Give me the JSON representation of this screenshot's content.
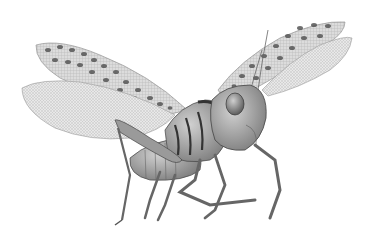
{
  "image": {
    "subject": "locust",
    "description": "Grayscale illustration of a flying locust with spotted forewings and translucent veined hindwings",
    "background": "#ffffff",
    "colors": {
      "wing_fill": "#d8d8d8",
      "wing_spot": "#555555",
      "hindwing_fill": "#e6e6e6",
      "body_fill": "#a8a8a8",
      "body_dark": "#5a5a5a",
      "outline": "#444444"
    }
  }
}
